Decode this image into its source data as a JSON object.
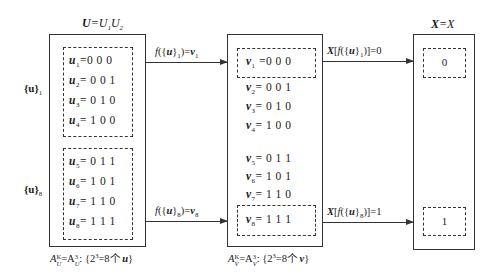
{
  "diagram": {
    "boxes": {
      "U": {
        "title_bold": "U",
        "title_rest": "=U",
        "title_sub1": "1",
        "title_mid": "U",
        "title_sub2": "2",
        "group1_label": "{u}",
        "group1_sub": "1",
        "group2_label": "{u}",
        "group2_sub": "8",
        "rows": [
          {
            "var": "u",
            "sub": "1",
            "value": "=0 0 0"
          },
          {
            "var": "u",
            "sub": "2",
            "value": "= 0 0 1"
          },
          {
            "var": "u",
            "sub": "3",
            "value": "= 0 1 0"
          },
          {
            "var": "u",
            "sub": "4",
            "value": "= 1 0 0"
          },
          {
            "var": "u",
            "sub": "5",
            "value": "= 0 1 1"
          },
          {
            "var": "u",
            "sub": "6",
            "value": "= 1 0 1"
          },
          {
            "var": "u",
            "sub": "7",
            "value": "= 1 1 0"
          },
          {
            "var": "u",
            "sub": "8",
            "value": "= 1 1 1"
          }
        ],
        "caption": {
          "a": "A",
          "a_sup": "K",
          "a_sub": "U",
          "eq": "=A",
          "b_sup": "3",
          "b_sub": "U",
          "rest": ": {2",
          "exp": "3",
          "tail": "=8个 ",
          "var": "u",
          "close": "}"
        }
      },
      "V": {
        "rows": [
          {
            "var": "v",
            "sub": "1",
            "value": " =0 0 0"
          },
          {
            "var": "v",
            "sub": "2",
            "value": "= 0 0 1"
          },
          {
            "var": "v",
            "sub": "3",
            "value": "= 0 1 0"
          },
          {
            "var": "v",
            "sub": "4",
            "value": "= 1 0 0"
          },
          {
            "var": "v",
            "sub": "5",
            "value": "= 0 1 1"
          },
          {
            "var": "v",
            "sub": "6",
            "value": "= 1 0 1"
          },
          {
            "var": "v",
            "sub": "7",
            "value": "= 1 1 0"
          },
          {
            "var": "v",
            "sub": "8",
            "value": "= 1 1 1"
          }
        ],
        "caption": {
          "a": "A",
          "a_sup": "K",
          "a_sub": "V",
          "eq": "=A",
          "b_sup": "3",
          "b_sub": "V",
          "rest": ": {2",
          "exp": "3",
          "tail": "=8个 ",
          "var": "v",
          "close": "}"
        }
      },
      "X": {
        "title_bold": "X",
        "title_rest": "=X",
        "values": [
          "0",
          "1"
        ]
      }
    },
    "arrows": [
      {
        "f": "f",
        "open": "({",
        "var": "u",
        "close": "}",
        "sub": "1",
        "eq": ")=",
        "res": "v",
        "res_sub": "1"
      },
      {
        "f": "f",
        "open": "({",
        "var": "u",
        "close": "}",
        "sub": "8",
        "eq": ")=",
        "res": "v",
        "res_sub": "8"
      },
      {
        "x": "X",
        "open1": "[",
        "f": "f",
        "open2": "({",
        "var": "u",
        "close": "}",
        "sub": "1",
        "tail": ")]=0"
      },
      {
        "x": "X",
        "open1": "[",
        "f": "f",
        "open2": "({",
        "var": "u",
        "close": "}",
        "sub": "8",
        "tail": ")]=1"
      }
    ]
  }
}
